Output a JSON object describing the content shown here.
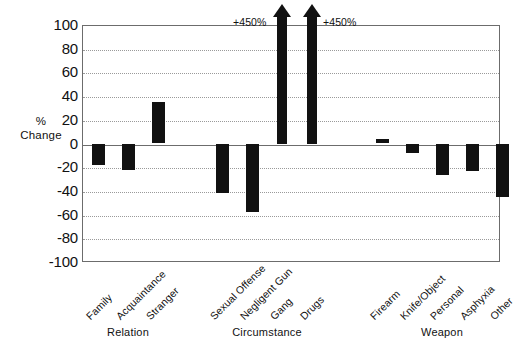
{
  "chart_data": {
    "type": "bar",
    "title": "",
    "subtitle": "",
    "xlabel": "",
    "ylabel": "% Change",
    "ylabel_lines": [
      "%",
      "Change"
    ],
    "ylim": [
      -100,
      100
    ],
    "yticks": [
      100,
      80,
      60,
      40,
      20,
      0,
      -20,
      -40,
      -60,
      -80,
      -100
    ],
    "ytick_labels": [
      "100",
      "80",
      "60",
      "40",
      "20",
      "0",
      "-20",
      "-40",
      "-60",
      "-80",
      "-100"
    ],
    "grid": true,
    "grid_style": "dotted-horizontal",
    "legend": "none",
    "bar_color": "#111111",
    "axis_color": "#6c6c6c",
    "categories": [
      "Family",
      "Acquaintance",
      "Stranger",
      "Sexual Offense",
      "Negligent Gun",
      "Gang",
      "Drugs",
      "Firearm",
      "Knife/Object",
      "Personal",
      "Asphyxia",
      "Other"
    ],
    "values": [
      -18,
      -22,
      35,
      -42,
      -58,
      450,
      450,
      4,
      -8,
      -27,
      -23,
      -45
    ],
    "off_scale_points": [
      {
        "category": "Gang",
        "value": 450,
        "label": "+450%"
      },
      {
        "category": "Drugs",
        "value": 450,
        "label": "+450%"
      }
    ],
    "groups": [
      {
        "label": "Relation",
        "categories": [
          "Family",
          "Acquaintance",
          "Stranger"
        ]
      },
      {
        "label": "Circumstance",
        "categories": [
          "Sexual Offense",
          "Negligent Gun",
          "Gang",
          "Drugs"
        ]
      },
      {
        "label": "Weapon",
        "categories": [
          "Firearm",
          "Knife/Object",
          "Personal",
          "Asphyxia",
          "Other"
        ]
      }
    ]
  }
}
